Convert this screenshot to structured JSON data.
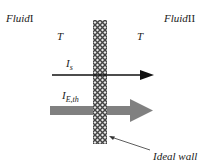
{
  "fluid_left": {
    "name": "Fluid",
    "numeral": "I"
  },
  "fluid_right": {
    "name": "Fluid",
    "numeral": "II"
  },
  "temp_left": "T",
  "temp_right": "T",
  "flow_s": {
    "main": "I",
    "sub": "s"
  },
  "flow_eth": {
    "main": "I",
    "sub": "E,th"
  },
  "wall_label": "Ideal wall",
  "colors": {
    "thin_arrow": "#111111",
    "thick_arrow": "#808080",
    "wall": "#555555"
  }
}
